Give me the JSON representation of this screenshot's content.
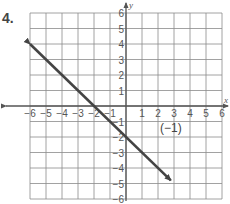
{
  "problem": {
    "number": "4."
  },
  "graph": {
    "x_axis_label": "x",
    "y_axis_label": "y",
    "x_range": [
      -6,
      6
    ],
    "y_range": [
      -6,
      6
    ],
    "x_ticks": [
      "-6",
      "-5",
      "-4",
      "-3",
      "-2",
      "-1",
      "1",
      "2",
      "3",
      "4",
      "5",
      "6"
    ],
    "y_ticks": [
      "6",
      "5",
      "4",
      "3",
      "2",
      "1",
      "-1",
      "-2",
      "-3",
      "-4",
      "-5",
      "-6"
    ],
    "line": {
      "from": [
        -6,
        4
      ],
      "to": [
        2.8,
        -4.8
      ],
      "slope": -1,
      "y_intercept": -2,
      "arrows": "both"
    },
    "annotation": {
      "text": "(−1)",
      "position": [
        2.8,
        -1.7
      ]
    },
    "colors": {
      "line": "#444444",
      "grid": "#8a8a8a",
      "axis": "#555555"
    }
  },
  "chart_data": {
    "type": "line",
    "title": "4.",
    "xlabel": "x",
    "ylabel": "y",
    "xlim": [
      -6,
      6
    ],
    "ylim": [
      -6,
      6
    ],
    "grid": true,
    "series": [
      {
        "name": "line",
        "x": [
          -6,
          -2,
          0,
          2,
          2.8
        ],
        "y": [
          4,
          0,
          -2,
          -4,
          -4.8
        ],
        "slope": -1,
        "intercept": -2
      }
    ],
    "annotations": [
      {
        "text": "(−1)",
        "x": 2.8,
        "y": -1.7
      }
    ]
  }
}
